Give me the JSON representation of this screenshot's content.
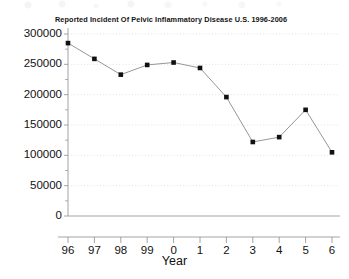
{
  "chart_data": {
    "type": "line",
    "title": "Reported Incident Of Pelvic Inflammatory Disease U.S. 1996-2006",
    "xlabel": "Year",
    "ylabel": "",
    "categories": [
      "96",
      "97",
      "98",
      "99",
      "0",
      "1",
      "2",
      "3",
      "4",
      "5",
      "6"
    ],
    "values": [
      285000,
      259000,
      233000,
      249000,
      253000,
      244000,
      196000,
      122000,
      130000,
      175000,
      105000
    ],
    "ylim": [
      0,
      300000
    ],
    "yticks": [
      0,
      50000,
      100000,
      150000,
      200000,
      250000,
      300000
    ],
    "ytick_labels": [
      "0",
      "50000",
      "100000",
      "150000",
      "200000",
      "250000",
      "300000"
    ],
    "grid": true,
    "grid_style": "dotted-horizontal",
    "legend": false,
    "marker": "square",
    "marker_color": "#111111",
    "line_color": "#8a8a8a",
    "axis_color": "#9a9a9a",
    "grid_color": "#d8d8d8",
    "background": "#ffffff"
  }
}
